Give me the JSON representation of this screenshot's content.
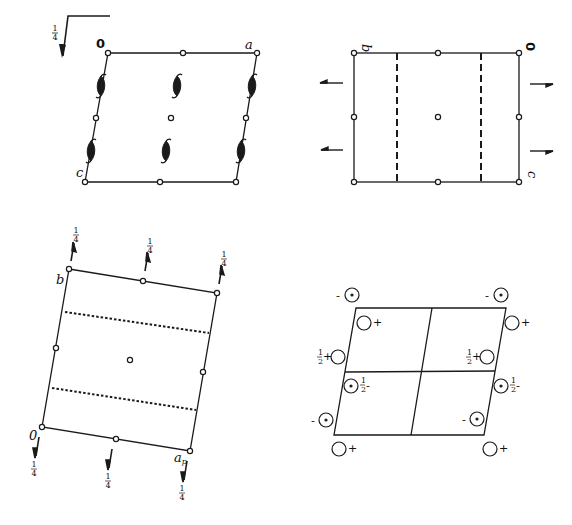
{
  "figure": {
    "colors": {
      "ink": "#1a1a1a",
      "background": "#ffffff"
    }
  },
  "panels": [
    {
      "id": "panel-top-left",
      "labels": {
        "origin": "0",
        "axis_right": "a",
        "axis_down": "c",
        "glide_height": "1/4"
      },
      "elements": [
        "inversion-centers",
        "2-fold-screw-axes",
        "glide-plane-corner-symbol"
      ]
    },
    {
      "id": "panel-top-right",
      "labels": {
        "origin": "0",
        "axis_left": "b",
        "axis_down": "c"
      },
      "elements": [
        "inversion-centers",
        "dashed-glide-planes",
        "side-arrows"
      ]
    },
    {
      "id": "panel-bottom-left",
      "labels": {
        "origin": "0",
        "axis_up": "b",
        "axis_right": "a_p",
        "top_arrow_height": "1/4",
        "bottom_arrow_height": "1/4"
      },
      "elements": [
        "inversion-centers",
        "dotted-glide-planes",
        "screw-axis-arrows"
      ]
    },
    {
      "id": "panel-bottom-right",
      "labels": {
        "plus": "+",
        "minus": "−",
        "half_plus": "½+",
        "half_minus": "½−"
      },
      "elements": [
        "general-positions",
        "unit-cell-quadrants"
      ]
    }
  ],
  "text": {
    "zero": "0",
    "a": "a",
    "b": "b",
    "c": "c",
    "a_p": "a",
    "a_p_sub": "p",
    "quarter_num": "1",
    "quarter_den": "4",
    "half_num": "1",
    "half_den": "2",
    "plus": "+",
    "minus": "−",
    "dash": "-"
  }
}
